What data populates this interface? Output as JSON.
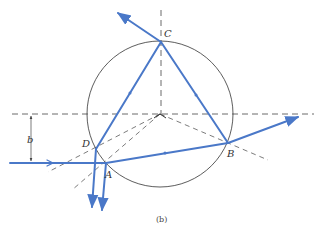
{
  "figure": {
    "caption": "(b)",
    "caption_label": "b",
    "points": {
      "A": "A",
      "B": "B",
      "C": "C",
      "D": "D"
    },
    "impact_parameter_label": "b",
    "colors": {
      "ray": "#4a78c8",
      "circle": "#333333",
      "dashed": "#444444"
    },
    "elements": [
      "circle (sphere cross-section)",
      "horizontal dashed axis through center",
      "vertical dashed line through center to C",
      "dashed normals from center through A, D, B",
      "incident ray at height b below axis hitting A",
      "refracted ray A to B, reflected B to C, C to D",
      "emergent rays from B, C, A, D"
    ]
  }
}
